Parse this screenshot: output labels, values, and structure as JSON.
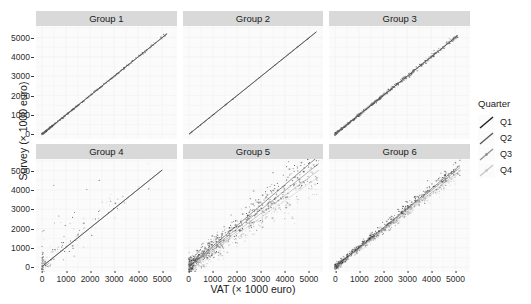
{
  "chart_data": {
    "type": "scatter",
    "title": "",
    "xlabel": "VAT (× 1000 euro)",
    "ylabel": "Survey (× 1000 euro)",
    "xlim": [
      -250,
      5600
    ],
    "ylim": [
      -250,
      5600
    ],
    "xticks": [
      0,
      1000,
      2000,
      3000,
      4000,
      5000
    ],
    "yticks": [
      0,
      1000,
      2000,
      3000,
      4000,
      5000
    ],
    "xticklabels": [
      "0",
      "1000",
      "2000",
      "3000",
      "4000",
      "5000"
    ],
    "yticklabels": [
      "0",
      "1000",
      "2000",
      "3000",
      "4000",
      "5000"
    ],
    "grid": true,
    "grid_color": "#eeeeee",
    "panel_background": "#fbfbfb",
    "strip_background": "#d9d9d9",
    "legend_position": "right",
    "facet_layout": {
      "rows": 2,
      "cols": 3
    },
    "legend": {
      "title": "Quarter",
      "entries": [
        {
          "label": "Q1",
          "color": "#1c1c1c"
        },
        {
          "label": "Q2",
          "color": "#5a5a5a"
        },
        {
          "label": "Q3",
          "color": "#949494"
        },
        {
          "label": "Q4",
          "color": "#c8c8c8"
        }
      ]
    },
    "facets": [
      {
        "label": "Group 1",
        "description": "Nearly perfect 1:1 agreement; points form a very tight dense band along the identity line, concentrated below 1500.",
        "fit_lines": [
          {
            "quarter": "Q1",
            "intercept": 0,
            "slope": 1.0,
            "color": "#1c1c1c"
          },
          {
            "quarter": "Q2",
            "intercept": 0,
            "slope": 1.0,
            "color": "#5a5a5a"
          },
          {
            "quarter": "Q3",
            "intercept": 0,
            "slope": 1.0,
            "color": "#949494"
          },
          {
            "quarter": "Q4",
            "intercept": 0,
            "slope": 1.0,
            "color": "#c8c8c8"
          }
        ],
        "n_points": 420,
        "scatter_sd": 45,
        "point_density_exp": 2.6,
        "x_max": 5200
      },
      {
        "label": "Group 2",
        "description": "Essentially a single straight line; scatter is invisible at this resolution, points lie exactly on the identity line.",
        "fit_lines": [
          {
            "quarter": "Q1",
            "intercept": 0,
            "slope": 1.0,
            "color": "#1c1c1c"
          },
          {
            "quarter": "Q2",
            "intercept": 0,
            "slope": 1.0,
            "color": "#5a5a5a"
          },
          {
            "quarter": "Q3",
            "intercept": 0,
            "slope": 1.0,
            "color": "#949494"
          },
          {
            "quarter": "Q4",
            "intercept": 0,
            "slope": 1.0,
            "color": "#c8c8c8"
          }
        ],
        "n_points": 60,
        "scatter_sd": 8,
        "point_density_exp": 1.0,
        "x_max": 5300
      },
      {
        "label": "Group 3",
        "description": "Very tight band along identity line over the whole range, slightly wider than Group 1 at the low end.",
        "fit_lines": [
          {
            "quarter": "Q1",
            "intercept": 0,
            "slope": 1.0,
            "color": "#1c1c1c"
          },
          {
            "quarter": "Q2",
            "intercept": 0,
            "slope": 1.0,
            "color": "#5a5a5a"
          },
          {
            "quarter": "Q3",
            "intercept": 0,
            "slope": 1.0,
            "color": "#949494"
          },
          {
            "quarter": "Q4",
            "intercept": 0,
            "slope": 1.0,
            "color": "#c8c8c8"
          }
        ],
        "n_points": 700,
        "scatter_sd": 75,
        "point_density_exp": 2.0,
        "x_max": 5100
      },
      {
        "label": "Group 4",
        "description": "Sparse cloud with strong positive skew above the identity line; many outliers at low VAT with high Survey values.",
        "fit_lines": [
          {
            "quarter": "Q1",
            "intercept": 30,
            "slope": 1.0,
            "color": "#1c1c1c"
          },
          {
            "quarter": "Q2",
            "intercept": 30,
            "slope": 1.0,
            "color": "#5a5a5a"
          },
          {
            "quarter": "Q3",
            "intercept": 30,
            "slope": 1.0,
            "color": "#949494"
          },
          {
            "quarter": "Q4",
            "intercept": 30,
            "slope": 1.0,
            "color": "#c8c8c8"
          }
        ],
        "n_points": 150,
        "scatter_sd": 700,
        "point_density_exp": 3.2,
        "x_max": 5000
      },
      {
        "label": "Group 5",
        "description": "Broad dispersed cloud around the diagonal with four clearly separated quarter regression lines fanning out; largest spread of all panels.",
        "fit_lines": [
          {
            "quarter": "Q1",
            "intercept": 40,
            "slope": 1.06,
            "color": "#1c1c1c"
          },
          {
            "quarter": "Q2",
            "intercept": 20,
            "slope": 0.99,
            "color": "#5a5a5a"
          },
          {
            "quarter": "Q3",
            "intercept": 0,
            "slope": 0.93,
            "color": "#949494"
          },
          {
            "quarter": "Q4",
            "intercept": -20,
            "slope": 0.87,
            "color": "#c8c8c8"
          }
        ],
        "n_points": 900,
        "scatter_sd": 620,
        "point_density_exp": 1.9,
        "x_max": 5400
      },
      {
        "label": "Group 6",
        "description": "Tight elongated band along the diagonal, widening modestly above 3000; quarter lines nearly coincide.",
        "fit_lines": [
          {
            "quarter": "Q1",
            "intercept": 15,
            "slope": 1.01,
            "color": "#1c1c1c"
          },
          {
            "quarter": "Q2",
            "intercept": 10,
            "slope": 0.99,
            "color": "#5a5a5a"
          },
          {
            "quarter": "Q3",
            "intercept": 5,
            "slope": 0.96,
            "color": "#949494"
          },
          {
            "quarter": "Q4",
            "intercept": 0,
            "slope": 0.94,
            "color": "#c8c8c8"
          }
        ],
        "n_points": 800,
        "scatter_sd": 210,
        "point_density_exp": 1.7,
        "x_max": 5200
      }
    ]
  }
}
